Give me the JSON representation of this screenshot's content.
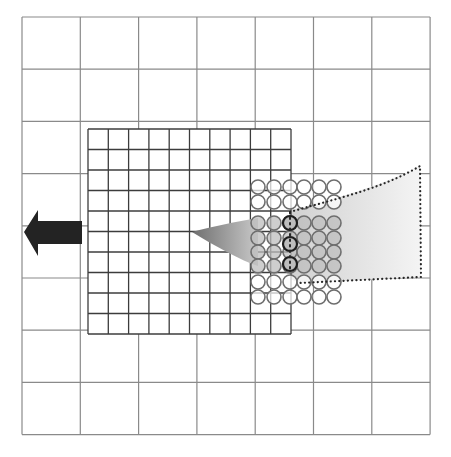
{
  "canvas": {
    "width": 451,
    "height": 457,
    "background": "#ffffff"
  },
  "colors": {
    "coarse_grid": "#8a8a8a",
    "fine_grid": "#3c3c3c",
    "circle_stroke": "#6e6e6e",
    "circle_fill_inside": "#bdbdbd",
    "dark_circle_stroke": "#1e1e1e",
    "arrow_fill": "#232323",
    "gradient_dark": "#6f6f6f",
    "gradient_light": "#f4f4f4",
    "dotted_outline": "#262626"
  },
  "coarse_grid": {
    "x0": 22,
    "y0": 17,
    "cols": 7,
    "rows": 8,
    "cell_w": 58.3,
    "cell_h": 52.2
  },
  "fine_grid": {
    "x0": 88,
    "y0": 129,
    "cols": 10,
    "rows": 10,
    "cell_w": 20.3,
    "cell_h": 20.5
  },
  "circles": {
    "radius": 7,
    "col_x": [
      258,
      274,
      290,
      304,
      319,
      334
    ],
    "row_y": [
      187,
      202,
      223,
      238,
      252,
      266,
      282,
      297
    ],
    "filled_rows": [
      2,
      3,
      4,
      5
    ],
    "dark_circles": [
      {
        "x": 290,
        "y": 223
      },
      {
        "x": 290,
        "y": 244
      },
      {
        "x": 290,
        "y": 264
      }
    ]
  },
  "arrow": {
    "direction": "left",
    "points": "24,232 38,210 38,221 82,221 82,244 38,244 38,256"
  },
  "gradient_wedge": {
    "path": "M192,232 C215,226 235,222 258,218 L258,266 C240,260 215,246 192,232 Z"
  },
  "dotted_region": {
    "path": "M290,212 C330,200 380,190 420,166 L421,277 L300,283",
    "fill_path": "M258,218 C300,208 370,192 420,166 L421,277 L300,283 L258,266 Z"
  },
  "dark_circle_axis": {
    "x": 290,
    "y1": 212,
    "y2": 272
  }
}
